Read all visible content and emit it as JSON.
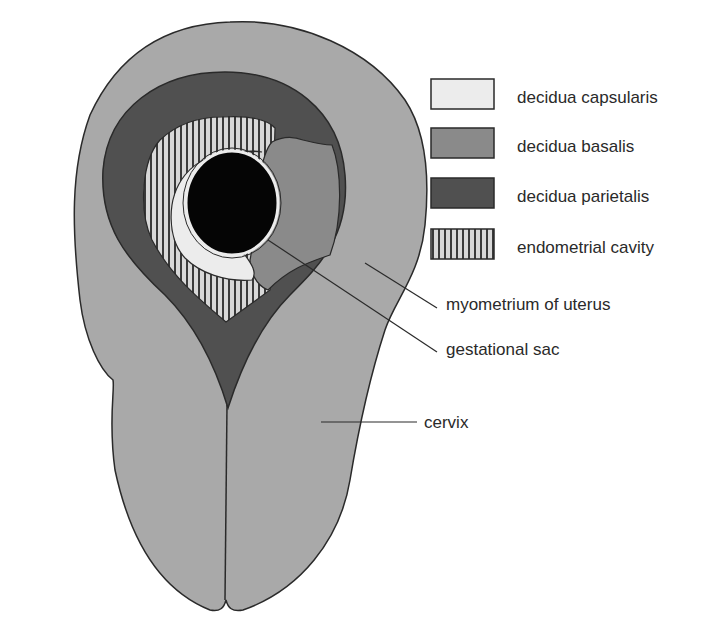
{
  "diagram": {
    "colors": {
      "myometrium": "#a9a9a9",
      "decidua_parietalis": "#505050",
      "decidua_basalis": "#8a8a8a",
      "decidua_capsularis": "#ececec",
      "endometrial_cavity_bg": "#d8d8d8",
      "endometrial_cavity_stripe": "#3a3a3a",
      "gestational_sac": "#050505",
      "outline": "#2a2a2a",
      "text": "#2a2a2a"
    },
    "legend": [
      {
        "label": "decidua capsularis",
        "swatch": "light"
      },
      {
        "label": "decidua basalis",
        "swatch": "medium"
      },
      {
        "label": "decidua parietalis",
        "swatch": "dark"
      },
      {
        "label": "endometrial cavity",
        "swatch": "striped"
      }
    ],
    "callouts": [
      {
        "label": "myometrium of uterus"
      },
      {
        "label": "gestational sac"
      },
      {
        "label": "cervix"
      }
    ]
  }
}
